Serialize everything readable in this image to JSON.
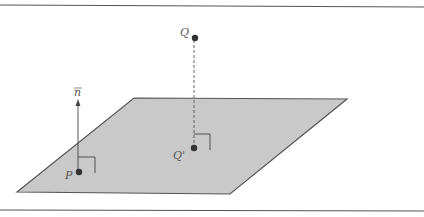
{
  "diagram": {
    "labels": {
      "Q": "Q",
      "Q_prime": "Q'",
      "P": "P",
      "n": "n"
    },
    "colors": {
      "plane_fill": "#c8c8c8",
      "plane_stroke": "#555555",
      "line": "#444444",
      "point": "#333333"
    }
  }
}
